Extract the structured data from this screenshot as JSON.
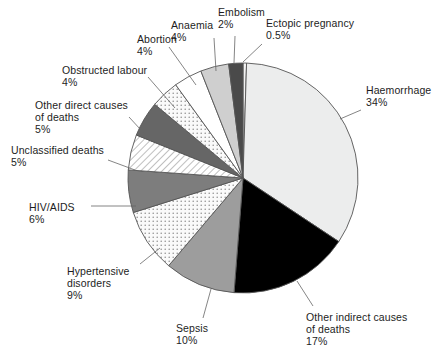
{
  "chart_data": {
    "type": "pie",
    "title": "",
    "subtitle": "",
    "xlabel": "",
    "ylabel": "",
    "legend_position": "none",
    "grid": false,
    "labels_outside": true,
    "start_angle_deg": 0,
    "direction": "clockwise",
    "categories": [
      "Ectopic pregnancy",
      "Haemorrhage",
      "Other indirect causes of deaths",
      "Sepsis",
      "Hypertensive disorders",
      "HIV/AIDS",
      "Unclassified deaths",
      "Other direct causes of deaths",
      "Obstructed labour",
      "Abortion",
      "Anaemia",
      "Embolism"
    ],
    "values": [
      0.5,
      34,
      17,
      10,
      9,
      6,
      5,
      5,
      4,
      4,
      4,
      2
    ],
    "value_labels": [
      "0.5%",
      "34%",
      "17%",
      "10%",
      "9%",
      "6%",
      "5%",
      "5%",
      "4%",
      "4%",
      "4%",
      "2%"
    ],
    "units": "percent",
    "total": 100.5
  },
  "slices": [
    {
      "id": "ectopic-pregnancy",
      "name": "Ectopic pregnancy",
      "value": 0.5,
      "value_label": "0.5%",
      "fill": "#f2f2f2",
      "pattern": "solid",
      "label_lines": [
        "Ectopic pregnancy",
        "0.5%"
      ],
      "label_x": 266,
      "label_y": 17,
      "align": "l",
      "leader": [
        [
          262,
          44
        ],
        [
          243,
          62
        ]
      ]
    },
    {
      "id": "haemorrhage",
      "name": "Haemorrhage",
      "value": 34,
      "value_label": "34%",
      "fill": "#eceded",
      "pattern": "solid",
      "label_lines": [
        "Haemorrhage",
        "34%"
      ],
      "label_x": 366,
      "label_y": 84,
      "align": "l",
      "leader": [
        [
          361,
          110
        ],
        [
          340,
          119
        ]
      ]
    },
    {
      "id": "other-indirect-causes-of-deaths",
      "name": "Other indirect causes of deaths",
      "value": 17,
      "value_label": "17%",
      "fill": "#000000",
      "pattern": "solid",
      "label_lines": [
        "Other indirect causes",
        "of deaths",
        "17%"
      ],
      "label_x": 306,
      "label_y": 311,
      "align": "l",
      "leader": [
        [
          313,
          306
        ],
        [
          297,
          281
        ]
      ]
    },
    {
      "id": "sepsis",
      "name": "Sepsis",
      "value": 10,
      "value_label": "10%",
      "fill": "#9d9d9d",
      "pattern": "solid",
      "label_lines": [
        "Sepsis",
        "10%"
      ],
      "label_x": 176,
      "label_y": 322,
      "align": "l",
      "leader": [
        [
          203,
          318
        ],
        [
          211,
          289
        ]
      ]
    },
    {
      "id": "hypertensive-disorders",
      "name": "Hypertensive disorders",
      "value": 9,
      "value_label": "9%",
      "fill": "#f4f4f4",
      "pattern": "dots",
      "label_lines": [
        "Hypertensive",
        "disorders",
        "9%"
      ],
      "label_x": 67,
      "label_y": 265,
      "align": "l",
      "leader": [
        [
          140,
          264
        ],
        [
          160,
          248
        ]
      ]
    },
    {
      "id": "hiv-aids",
      "name": "HIV/AIDS",
      "value": 6,
      "value_label": "6%",
      "fill": "#7d7d7d",
      "pattern": "solid",
      "label_lines": [
        "HIV/AIDS",
        "6%"
      ],
      "label_x": 29,
      "label_y": 201,
      "align": "l",
      "leader": [
        [
          91,
          206
        ],
        [
          136,
          206
        ]
      ]
    },
    {
      "id": "unclassified-deaths",
      "name": "Unclassified deaths",
      "value": 5,
      "value_label": "5%",
      "fill": "#ffffff",
      "pattern": "hatch",
      "label_lines": [
        "Unclassified deaths",
        "5%"
      ],
      "label_x": 11,
      "label_y": 144,
      "align": "l",
      "leader": [
        [
          108,
          160
        ],
        [
          135,
          170
        ]
      ]
    },
    {
      "id": "other-direct-causes-of-deaths",
      "name": "Other direct causes of deaths",
      "value": 5,
      "value_label": "5%",
      "fill": "#666666",
      "pattern": "solid",
      "label_lines": [
        "Other direct causes",
        "of deaths",
        "5%"
      ],
      "label_x": 35,
      "label_y": 99,
      "align": "l",
      "leader": [
        [
          129,
          117
        ],
        [
          152,
          142
        ]
      ]
    },
    {
      "id": "obstructed-labour",
      "name": "Obstructed labour",
      "value": 4,
      "value_label": "4%",
      "fill": "#fbfbfb",
      "pattern": "dots",
      "label_lines": [
        "Obstructed labour",
        "4%"
      ],
      "label_x": 62,
      "label_y": 64,
      "align": "l",
      "leader": [
        [
          148,
          77
        ],
        [
          175,
          108
        ]
      ]
    },
    {
      "id": "abortion",
      "name": "Abortion",
      "value": 4,
      "value_label": "4%",
      "fill": "#ffffff",
      "pattern": "solid",
      "label_lines": [
        "Abortion",
        "4%"
      ],
      "label_x": 137,
      "label_y": 33,
      "align": "l",
      "leader": [
        [
          169,
          47
        ],
        [
          196,
          85
        ]
      ]
    },
    {
      "id": "anaemia",
      "name": "Anaemia",
      "value": 4,
      "value_label": "4%",
      "fill": "#cfcfcf",
      "pattern": "solid",
      "label_lines": [
        "Anaemia",
        "4%"
      ],
      "label_x": 171,
      "label_y": 19,
      "align": "l",
      "leader": [
        [
          214,
          38
        ],
        [
          216,
          71
        ]
      ]
    },
    {
      "id": "embolism",
      "name": "Embolism",
      "value": 2,
      "value_label": "2%",
      "fill": "#4a4a4a",
      "pattern": "solid",
      "label_lines": [
        "Embolism",
        "2%"
      ],
      "label_x": 218,
      "label_y": 6,
      "align": "l",
      "leader": [
        [
          235,
          36
        ],
        [
          234,
          63
        ]
      ]
    }
  ],
  "geometry": {
    "center_x": 243,
    "center_y": 178,
    "radius": 115,
    "stroke": "#555555",
    "stroke_width": 0.9
  },
  "colors": {
    "background": "#ffffff",
    "text": "#1d1d1d",
    "leader_line": "#666666",
    "slice_outline": "#555555"
  }
}
